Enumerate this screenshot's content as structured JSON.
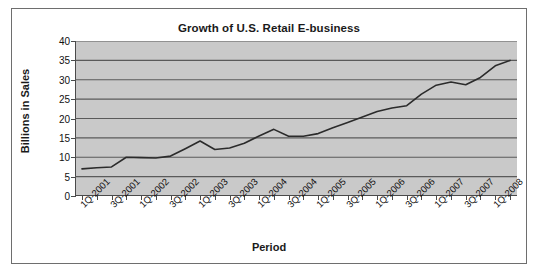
{
  "chart_data": {
    "type": "line",
    "title": "Growth of U.S. Retail E-business",
    "xlabel": "Period",
    "ylabel": "Billions in Sales",
    "ylim": [
      0,
      40
    ],
    "ytick_values": [
      0,
      5,
      10,
      15,
      20,
      25,
      30,
      35,
      40
    ],
    "ytick_labels": [
      "0",
      "5",
      "10",
      "15",
      "20",
      "25",
      "30",
      "35",
      "40"
    ],
    "grid": true,
    "legend": "none",
    "plot_background": "#c9c9c9",
    "line_color": "#2b2b2b",
    "categories": [
      "1Q-2001",
      "2Q-2001",
      "3Q-2001",
      "4Q-2001",
      "1Q-2002",
      "2Q-2002",
      "3Q-2002",
      "4Q-2002",
      "1Q-2003",
      "2Q-2003",
      "3Q-2003",
      "4Q-2003",
      "1Q-2004",
      "2Q-2004",
      "3Q-2004",
      "4Q-2004",
      "1Q-2005",
      "2Q-2005",
      "3Q-2005",
      "4Q-2005",
      "1Q-2006",
      "2Q-2006",
      "3Q-2006",
      "4Q-2006",
      "1Q-2007",
      "2Q-2007",
      "3Q-2007",
      "4Q-2007",
      "1Q-2008",
      "2Q-2008"
    ],
    "xtick_labels": [
      "1Q-2001",
      "3Q-2001",
      "1Q-2002",
      "3Q-2002",
      "1Q-2003",
      "3Q-2003",
      "1Q-2004",
      "3Q-2004",
      "1Q-2005",
      "3Q-2005",
      "1Q-2006",
      "3Q-2006",
      "1Q-2007",
      "3Q-2007",
      "1Q-2008"
    ],
    "values": [
      7.0,
      7.3,
      7.5,
      10.0,
      9.9,
      9.8,
      10.3,
      12.2,
      14.2,
      12.0,
      12.4,
      13.6,
      15.5,
      17.2,
      15.4,
      15.4,
      16.1,
      17.6,
      19.0,
      20.4,
      21.8,
      22.7,
      23.3,
      26.3,
      28.6,
      29.4,
      28.7,
      30.6,
      33.6,
      35.0
    ],
    "series_name": "U.S. Retail E-business Sales"
  }
}
